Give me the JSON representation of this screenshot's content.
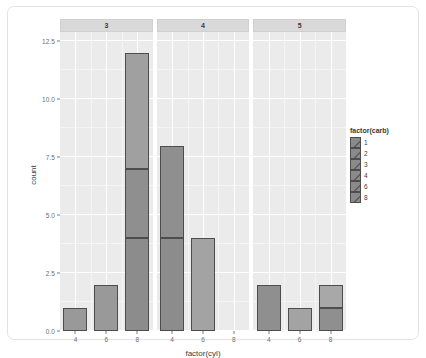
{
  "chart_data": {
    "type": "bar",
    "title": "",
    "subtitle": "",
    "xlabel": "factor(cyl)",
    "ylabel": "count",
    "stacked": true,
    "grid": true,
    "legend_position": "right",
    "legend_title": "factor(carb)",
    "categories": [
      "4",
      "6",
      "8"
    ],
    "ylim": [
      0,
      12.9
    ],
    "yticks": [
      "0.0",
      "2.5",
      "5.0",
      "7.5",
      "10.0",
      "12.5"
    ],
    "ytick_values": [
      0,
      2.5,
      5,
      7.5,
      10,
      12.5
    ],
    "xticks": [
      "4",
      "6",
      "8"
    ],
    "facet_variable": "gear",
    "facets": [
      {
        "label": "3",
        "bars": [
          {
            "category": "4",
            "total": 1,
            "segments": [
              {
                "carb": "1",
                "value": 1,
                "color": "#999999"
              }
            ]
          },
          {
            "category": "6",
            "total": 2,
            "segments": [
              {
                "carb": "1",
                "value": 2,
                "color": "#999999"
              }
            ]
          },
          {
            "category": "8",
            "total": 12,
            "segments": [
              {
                "carb": "2",
                "value": 4,
                "color": "#8c8c8c"
              },
              {
                "carb": "3",
                "value": 3,
                "color": "#8f8f8f"
              },
              {
                "carb": "4",
                "value": 5,
                "color": "#a0a0a0"
              }
            ]
          }
        ]
      },
      {
        "label": "4",
        "bars": [
          {
            "category": "4",
            "total": 8,
            "segments": [
              {
                "carb": "1",
                "value": 4,
                "color": "#8c8c8c"
              },
              {
                "carb": "2",
                "value": 4,
                "color": "#8f8f8f"
              }
            ]
          },
          {
            "category": "6",
            "total": 4,
            "segments": [
              {
                "carb": "4",
                "value": 4,
                "color": "#a3a3a3"
              }
            ]
          }
        ]
      },
      {
        "label": "5",
        "bars": [
          {
            "category": "4",
            "total": 2,
            "segments": [
              {
                "carb": "2",
                "value": 2,
                "color": "#8f8f8f"
              }
            ]
          },
          {
            "category": "6",
            "total": 1,
            "segments": [
              {
                "carb": "2",
                "value": 1,
                "color": "#a3a3a3"
              }
            ]
          },
          {
            "category": "8",
            "total": 2,
            "segments": [
              {
                "carb": "6",
                "value": 1,
                "color": "#8f8f8f"
              },
              {
                "carb": "8",
                "value": 1,
                "color": "#a8a8a8"
              }
            ]
          }
        ]
      }
    ],
    "legend_entries": [
      {
        "label": "1",
        "color": "#8a8a8a"
      },
      {
        "label": "2",
        "color": "#8a8a8a"
      },
      {
        "label": "3",
        "color": "#8a8a8a"
      },
      {
        "label": "4",
        "color": "#8a8a8a"
      },
      {
        "label": "6",
        "color": "#8a8a8a"
      },
      {
        "label": "8",
        "color": "#8a8a8a"
      }
    ]
  },
  "colors": {
    "panel_background": "#ebebeb",
    "strip_background": "#d9d9d9",
    "gridline_major": "#ffffff",
    "gridline_minor": "#f5f5f5",
    "bar_outline": "#4d4d4d",
    "axis_text": "#6e6e6e",
    "axis_title": "#3c3c3c",
    "frame_border": "#e3e3e3",
    "page_background": "#ffffff"
  }
}
